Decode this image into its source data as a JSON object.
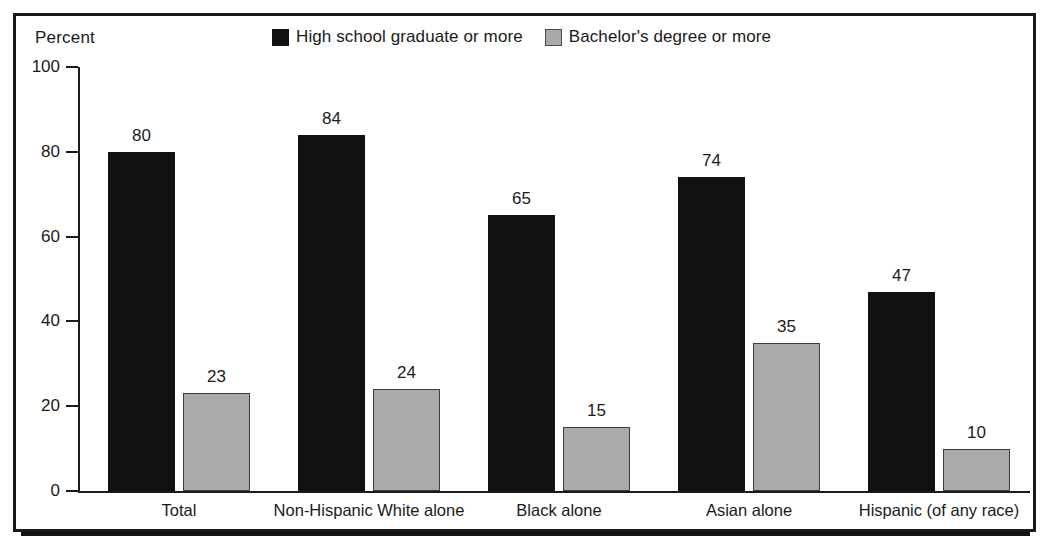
{
  "figure": {
    "axis_caption": "Percent",
    "legend": [
      {
        "label": "High school graduate or more",
        "swatch": "dark-square-icon",
        "color": "#111111"
      },
      {
        "label": "Bachelor's degree or more",
        "swatch": "light-square-icon",
        "color": "#a9a9a9"
      }
    ]
  },
  "chart_data": {
    "type": "bar",
    "title": "",
    "xlabel": "",
    "ylabel": "Percent",
    "ylim": [
      0,
      100
    ],
    "yticks": [
      0,
      20,
      40,
      60,
      80,
      100
    ],
    "ytick_labels": [
      "0",
      "20",
      "40",
      "60",
      "80",
      "100"
    ],
    "grid": false,
    "legend_position": "top-center",
    "categories": [
      "Total",
      "Non-Hispanic White alone",
      "Black alone",
      "Asian alone",
      "Hispanic (of any race)"
    ],
    "series": [
      {
        "name": "High school graduate or more",
        "color": "#111111",
        "values": [
          80,
          84,
          65,
          74,
          47
        ],
        "labels": [
          "80",
          "84",
          "65",
          "74",
          "47"
        ]
      },
      {
        "name": "Bachelor's degree or more",
        "color": "#aaaaaa",
        "values": [
          23,
          24,
          15,
          35,
          10
        ],
        "labels": [
          "23",
          "24",
          "15",
          "35",
          "10"
        ]
      }
    ]
  }
}
